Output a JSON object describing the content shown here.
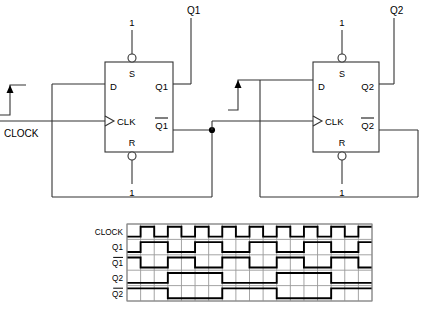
{
  "diagram": {
    "clock_label": "CLOCK",
    "edge_marker_name": "rising-edge-arrow",
    "flipflops": [
      {
        "id": "ff1",
        "pins": {
          "d": "D",
          "clk": "CLK",
          "s": "S",
          "r": "R",
          "q": "Q1",
          "qbar": "Q1"
        },
        "qbar_overline": true,
        "set_value": "1",
        "reset_value": "1",
        "output_label": "Q1",
        "box": {
          "x": 105,
          "y": 62,
          "w": 68,
          "h": 90
        }
      },
      {
        "id": "ff2",
        "pins": {
          "d": "D",
          "clk": "CLK",
          "s": "S",
          "r": "R",
          "q": "Q2",
          "qbar": "Q2"
        },
        "qbar_overline": true,
        "set_value": "1",
        "reset_value": "1",
        "output_label": "Q2",
        "box": {
          "x": 313,
          "y": 62,
          "w": 66,
          "h": 90
        }
      }
    ]
  },
  "chart_data": {
    "type": "line",
    "xlabel": "",
    "ylabel": "",
    "grid": true,
    "legend": "none",
    "cells": 18,
    "cell_width": 13.6,
    "frame": {
      "x": 127,
      "y": 224,
      "w": 245,
      "h": 77
    },
    "row_labels": [
      "CLOCK",
      "Q1",
      "Q1",
      "Q2",
      "Q2"
    ],
    "row_overline": [
      false,
      false,
      true,
      false,
      true
    ],
    "series": [
      {
        "name": "CLOCK",
        "period_cells": 2,
        "phase_cells": 1,
        "invert": false,
        "values": [
          0,
          1,
          0,
          1,
          0,
          1,
          0,
          1,
          0,
          1,
          0,
          1,
          0,
          1,
          0,
          1,
          0,
          1
        ]
      },
      {
        "name": "Q1",
        "period_cells": 4,
        "phase_cells": 1,
        "invert": false,
        "values": [
          0,
          1,
          1,
          0,
          0,
          1,
          1,
          0,
          0,
          1,
          1,
          0,
          0,
          1,
          1,
          0,
          0,
          1
        ]
      },
      {
        "name": "Q1bar",
        "period_cells": 4,
        "phase_cells": 1,
        "invert": true,
        "values": [
          1,
          0,
          0,
          1,
          1,
          0,
          0,
          1,
          1,
          0,
          0,
          1,
          1,
          0,
          0,
          1,
          1,
          0
        ]
      },
      {
        "name": "Q2",
        "period_cells": 8,
        "phase_cells": 3,
        "invert": false,
        "values": [
          0,
          0,
          0,
          1,
          1,
          1,
          1,
          0,
          0,
          0,
          0,
          1,
          1,
          1,
          1,
          0,
          0,
          0
        ]
      },
      {
        "name": "Q2bar",
        "period_cells": 8,
        "phase_cells": 3,
        "invert": true,
        "values": [
          1,
          1,
          1,
          0,
          0,
          0,
          0,
          1,
          1,
          1,
          1,
          0,
          0,
          0,
          0,
          1,
          1,
          1
        ]
      }
    ]
  }
}
